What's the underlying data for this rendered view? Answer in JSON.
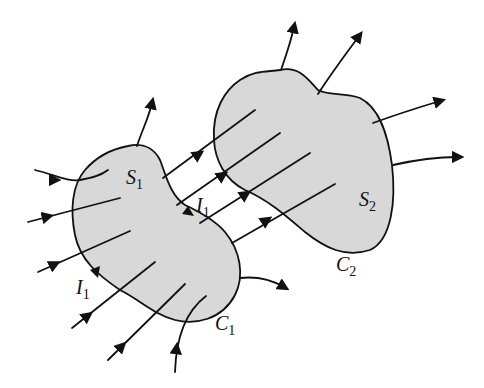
{
  "diagram": {
    "colors": {
      "region_fill": "#d8d8d8",
      "stroke": "#111111",
      "background": "#ffffff"
    },
    "labels": {
      "s1": {
        "main": "S",
        "sub": "1"
      },
      "s2": {
        "main": "S",
        "sub": "2"
      },
      "c1": {
        "main": "C",
        "sub": "1"
      },
      "c2": {
        "main": "C",
        "sub": "2"
      },
      "i1_top": {
        "main": "I",
        "sub": "1"
      },
      "i1_left": {
        "main": "I",
        "sub": "1"
      }
    }
  }
}
